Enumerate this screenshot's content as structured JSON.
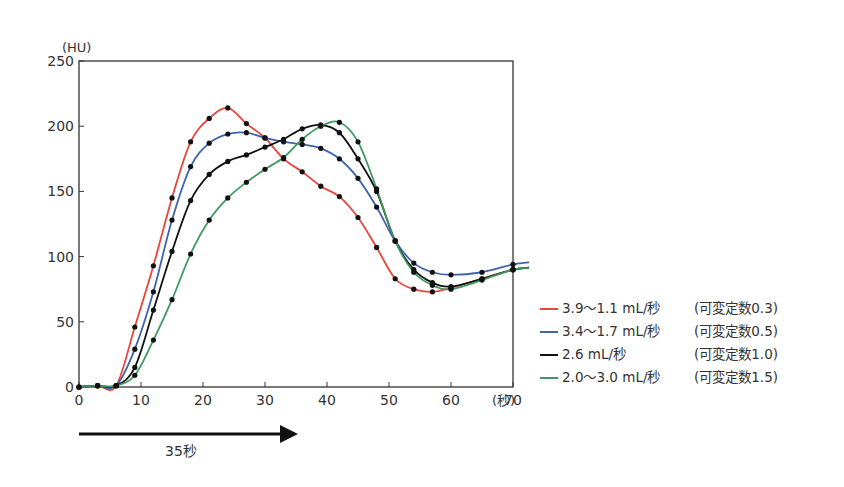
{
  "chart_data": {
    "type": "line",
    "title": "",
    "xlabel": "(秒)",
    "ylabel": "(HU)",
    "xlim": [
      0,
      70
    ],
    "ylim": [
      0,
      250
    ],
    "x_ticks": [
      0,
      10,
      20,
      30,
      40,
      50,
      60,
      70
    ],
    "y_ticks": [
      0,
      50,
      100,
      150,
      200,
      250
    ],
    "grid": false,
    "legend_position": "right",
    "markers": "black dots",
    "x": [
      0,
      3,
      6,
      9,
      12,
      15,
      18,
      21,
      24,
      27,
      30,
      33,
      36,
      39,
      42,
      45,
      48,
      51,
      54,
      57,
      60,
      65,
      70
    ],
    "series": [
      {
        "name": "3.9〜1.1 mL/秒 (可変定数0.3)",
        "rate": "3.9〜1.1 mL/秒",
        "constant": "(可変定数0.3)",
        "color": "#e8463a",
        "values": [
          0,
          1,
          1,
          46,
          93,
          145,
          188,
          206,
          214,
          202,
          191,
          175,
          165,
          154,
          146,
          130,
          107,
          83,
          75,
          73,
          76,
          83,
          90
        ]
      },
      {
        "name": "3.4〜1.7 mL/秒 (可変定数0.5)",
        "rate": "3.4〜1.7 mL/秒",
        "constant": "(可変定数0.5)",
        "color": "#3e64b0",
        "values": [
          0,
          1,
          1,
          29,
          73,
          128,
          169,
          187,
          194,
          195,
          191,
          188,
          186,
          183,
          175,
          160,
          138,
          112,
          95,
          88,
          86,
          88,
          94
        ]
      },
      {
        "name": "2.6 mL/秒 (可変定数1.0)",
        "rate": "2.6 mL/秒",
        "constant": "(可変定数1.0)",
        "color": "#111111",
        "values": [
          0,
          1,
          1,
          15,
          59,
          104,
          143,
          163,
          173,
          178,
          184,
          190,
          198,
          201,
          195,
          175,
          150,
          112,
          90,
          80,
          77,
          83,
          90
        ]
      },
      {
        "name": "2.0〜3.0 mL/秒 (可変定数1.5)",
        "rate": "2.0〜3.0 mL/秒",
        "constant": "(可変定数1.5)",
        "color": "#3e9a63",
        "values": [
          0,
          1,
          1,
          9,
          36,
          67,
          102,
          128,
          145,
          157,
          167,
          176,
          190,
          200,
          203,
          188,
          152,
          112,
          88,
          78,
          75,
          82,
          90
        ]
      }
    ],
    "annotations": [
      {
        "type": "arrow",
        "from_x": 0,
        "to_x": 35,
        "label": "35秒"
      }
    ]
  },
  "axis": {
    "y_unit": "(HU)",
    "x_unit": "(秒)"
  },
  "arrow": {
    "label": "35秒"
  },
  "legend": {
    "items": [
      {
        "rate": "3.9〜1.1 mL/秒",
        "constant": "(可変定数0.3)",
        "color": "#e8463a"
      },
      {
        "rate": "3.4〜1.7 mL/秒",
        "constant": "(可変定数0.5)",
        "color": "#3e64b0"
      },
      {
        "rate": "2.6 mL/秒",
        "constant": "(可変定数1.0)",
        "color": "#111111"
      },
      {
        "rate": "2.0〜3.0 mL/秒",
        "constant": "(可変定数1.5)",
        "color": "#3e9a63"
      }
    ]
  }
}
